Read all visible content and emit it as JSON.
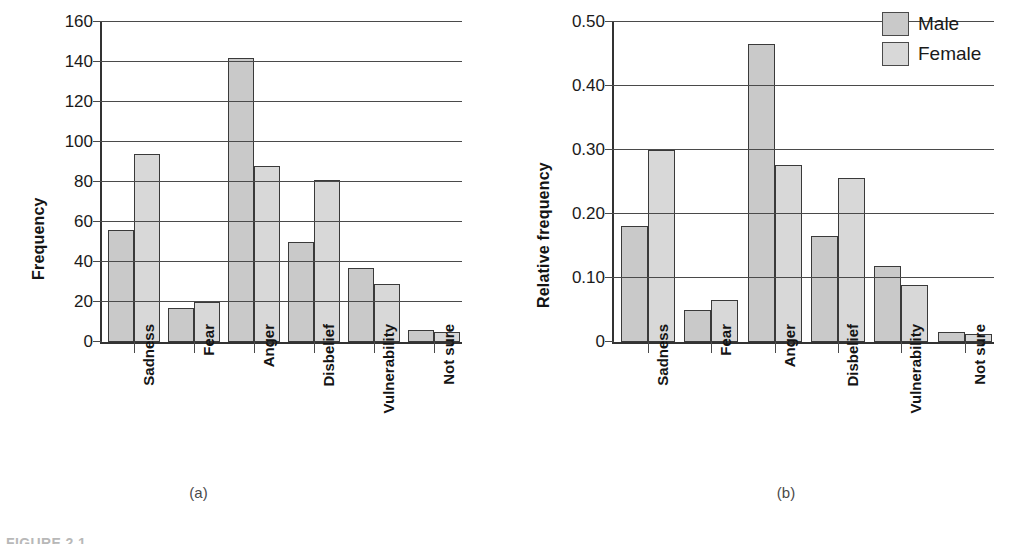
{
  "figure": {
    "caption_partial": "FIGURE 2.1",
    "subcaption_a": "(a)",
    "subcaption_b": "(b)"
  },
  "legend": {
    "position": "top-right",
    "items": [
      {
        "label": "Male",
        "color": "#c9c9c9"
      },
      {
        "label": "Female",
        "color": "#d8d8d8"
      }
    ]
  },
  "chart_data": [
    {
      "panel": "(a)",
      "type": "bar",
      "title": "",
      "xlabel": "",
      "ylabel": "Frequency",
      "ylim": [
        0,
        160
      ],
      "yticks": [
        "0",
        "20",
        "40",
        "60",
        "80",
        "100",
        "120",
        "140",
        "160"
      ],
      "ytick_values": [
        0,
        20,
        40,
        60,
        80,
        100,
        120,
        140,
        160
      ],
      "grid": "horizontal",
      "categories": [
        "Sadness",
        "Fear",
        "Anger",
        "Disbelief",
        "Vulnerability",
        "Not sure"
      ],
      "series": [
        {
          "name": "Male",
          "color": "#c9c9c9",
          "values": [
            56,
            17,
            142,
            50,
            37,
            6
          ]
        },
        {
          "name": "Female",
          "color": "#d8d8d8",
          "values": [
            94,
            20,
            88,
            81,
            29,
            5
          ]
        }
      ]
    },
    {
      "panel": "(b)",
      "type": "bar",
      "title": "",
      "xlabel": "",
      "ylabel": "Relative frequency",
      "ylim": [
        0,
        0.5
      ],
      "yticks": [
        "0",
        "0.10",
        "0.20",
        "0.30",
        "0.40",
        "0.50"
      ],
      "ytick_values": [
        0,
        0.1,
        0.2,
        0.3,
        0.4,
        0.5
      ],
      "grid": "horizontal",
      "categories": [
        "Sadness",
        "Fear",
        "Anger",
        "Disbelief",
        "Vulnerability",
        "Not sure"
      ],
      "series": [
        {
          "name": "Male",
          "color": "#c9c9c9",
          "values": [
            0.182,
            0.05,
            0.465,
            0.165,
            0.118,
            0.016
          ]
        },
        {
          "name": "Female",
          "color": "#d8d8d8",
          "values": [
            0.3,
            0.066,
            0.276,
            0.257,
            0.089,
            0.013
          ]
        }
      ]
    }
  ]
}
